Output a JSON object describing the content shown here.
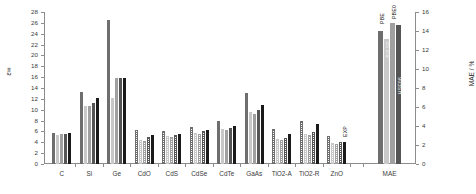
{
  "chart_data": {
    "type": "bar",
    "title": "",
    "xlabel": "",
    "ylabel": "ε∞",
    "ylabel_right": "MAE / %",
    "ylim": [
      0,
      28
    ],
    "ylim_right": [
      0,
      16
    ],
    "ytick_labels": [
      "0",
      "2",
      "4",
      "6",
      "8",
      "10",
      "12",
      "14",
      "16",
      "18",
      "20",
      "22",
      "24",
      "26",
      "28"
    ],
    "ytick_values": [
      0,
      2,
      4,
      6,
      8,
      10,
      12,
      14,
      16,
      18,
      20,
      22,
      24,
      26,
      28
    ],
    "ytick_right_labels": [
      "0",
      "2",
      "4",
      "6",
      "8",
      "10",
      "12",
      "14",
      "16"
    ],
    "ytick_right_values": [
      0,
      2,
      4,
      6,
      8,
      10,
      12,
      14,
      16
    ],
    "grid": false,
    "legend": "none",
    "categories": [
      "C",
      "Si",
      "Ge",
      "CdO",
      "CdS",
      "CdSe",
      "CdTe",
      "GaAs",
      "TiO2-A",
      "TiO2-R",
      "ZnO",
      "MAE"
    ],
    "series": [
      {
        "name": "PBE",
        "values": [
          5.8,
          13.2,
          26.5,
          6.2,
          6.0,
          6.9,
          8.0,
          13.0,
          6.5,
          8.0,
          5.2,
          null
        ]
      },
      {
        "name": "B3LYP",
        "values": [
          5.3,
          10.7,
          12.2,
          4.5,
          5.2,
          5.8,
          6.5,
          9.6,
          4.6,
          5.6,
          3.9,
          null
        ]
      },
      {
        "name": "PBE0",
        "values": [
          5.5,
          10.7,
          15.9,
          4.3,
          4.9,
          5.5,
          6.2,
          9.2,
          4.4,
          5.3,
          3.7,
          null
        ]
      },
      {
        "name": "HSE06",
        "values": [
          5.5,
          11.2,
          15.9,
          5.0,
          5.4,
          6.0,
          6.7,
          9.9,
          4.8,
          5.9,
          4.1,
          null
        ]
      },
      {
        "name": "EXP",
        "values": [
          5.7,
          12.1,
          15.9,
          5.4,
          5.5,
          6.3,
          7.0,
          10.9,
          5.6,
          7.3,
          4.0,
          null
        ]
      }
    ],
    "mae_group": {
      "categories_label": "MAE",
      "axis": "right",
      "bars": [
        {
          "label": "PBE",
          "value": 14.0
        },
        {
          "label": "B3LYP",
          "value": 13.2
        },
        {
          "label": "PBE0",
          "value": 14.8
        },
        {
          "label": "HSE06",
          "value": 14.6
        }
      ]
    },
    "annotations": [
      {
        "text": "EXP",
        "near": "ZnO"
      },
      {
        "text": "PBE",
        "near": "MAE"
      },
      {
        "text": "B3LYP",
        "near": "MAE"
      },
      {
        "text": "PBE0",
        "near": "MAE"
      },
      {
        "text": "HSE06",
        "near": "MAE"
      }
    ],
    "bar_fill_styles": [
      "solid-dark-gray",
      "solid-light-gray",
      "solid-mid-gray",
      "solid-dark",
      "solid-black",
      "hatched-checker"
    ],
    "colors": {
      "axis": "#8c8c8c",
      "text": "#3a3a3a",
      "bar_dark_gray": "#6e6e6e",
      "bar_light_gray": "#c8c8c8",
      "bar_mid_gray": "#a0a0a0",
      "bar_dark": "#5a5a5a",
      "bar_black": "#1a1a1a",
      "background": "#ffffff"
    }
  }
}
